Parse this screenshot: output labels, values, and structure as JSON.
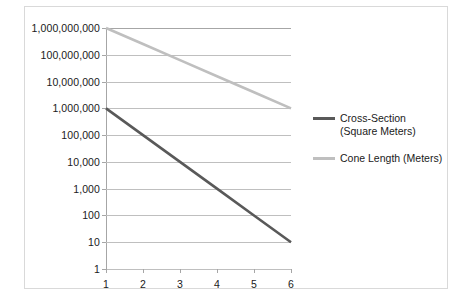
{
  "chart_data": {
    "type": "line",
    "title": "",
    "xlabel": "",
    "ylabel": "",
    "yscale": "log",
    "ylim": [
      1,
      1000000000
    ],
    "xlim": [
      1,
      6
    ],
    "grid": true,
    "legend_position": "right",
    "x": [
      1,
      2,
      3,
      4,
      5,
      6
    ],
    "y_ticks": [
      1,
      10,
      100,
      1000,
      10000,
      100000,
      1000000,
      10000000,
      100000000,
      1000000000
    ],
    "y_tick_labels": [
      "1",
      "10",
      "100",
      "1,000",
      "10,000",
      "100,000",
      "1,000,000",
      "10,000,000",
      "100,000,000",
      "1,000,000,000"
    ],
    "x_tick_labels": [
      "1",
      "2",
      "3",
      "4",
      "5",
      "6"
    ],
    "series": [
      {
        "name": "Cross-Section (Square Meters)",
        "color": "#595959",
        "values": [
          1000000,
          100000,
          10000,
          1000,
          100,
          10
        ]
      },
      {
        "name": "Cone Length (Meters)",
        "color": "#bfbfbf",
        "values": [
          1000000000,
          251188643,
          63095734,
          15848932,
          3981072,
          1000000
        ]
      }
    ]
  },
  "legend": {
    "entries": [
      {
        "label": "Cross-Section (Square Meters)",
        "color": "#595959"
      },
      {
        "label": "Cone Length (Meters)",
        "color": "#bfbfbf"
      }
    ]
  }
}
